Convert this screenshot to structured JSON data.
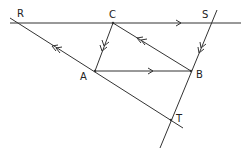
{
  "diagram": {
    "points": {
      "R": {
        "label": "R",
        "x": 17,
        "y": 23
      },
      "C": {
        "label": "C",
        "x": 113,
        "y": 23
      },
      "S": {
        "label": "S",
        "x": 211,
        "y": 23
      },
      "A": {
        "label": "A",
        "x": 95,
        "y": 71
      },
      "B": {
        "label": "B",
        "x": 191,
        "y": 71
      },
      "T": {
        "label": "T",
        "x": 171,
        "y": 120
      }
    },
    "labels": {
      "R": "R",
      "C": "C",
      "S": "S",
      "A": "A",
      "B": "B",
      "T": "T"
    },
    "parallel_marks": {
      "single_arrow": [
        "RS",
        "AB"
      ],
      "double_arrow": [
        "RT",
        "CB"
      ],
      "double_arrow_down": [
        "CA",
        "SB"
      ]
    },
    "colors": {
      "stroke": "#333333",
      "background": "#ffffff"
    }
  }
}
